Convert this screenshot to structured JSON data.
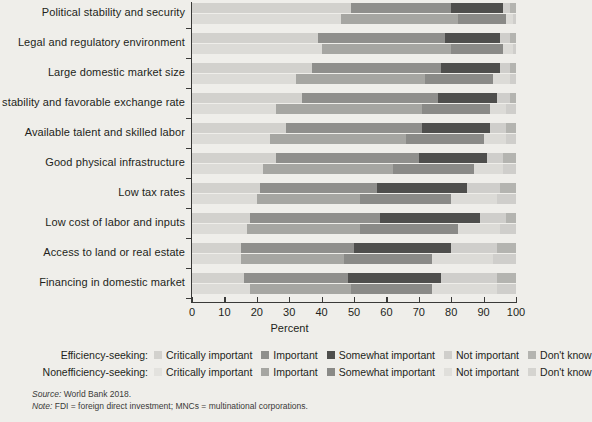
{
  "chart_data": {
    "type": "bar",
    "orientation": "horizontal",
    "stacked": true,
    "grouped_pairs": true,
    "title": "",
    "xlabel": "Percent",
    "ylabel": "",
    "xlim": [
      0,
      100
    ],
    "xticks": [
      0,
      10,
      20,
      30,
      40,
      50,
      60,
      70,
      80,
      90,
      100
    ],
    "grid": false,
    "legend_position": "bottom",
    "categories": [
      "Political stability and security",
      "Legal and regulatory environment",
      "Large domestic market size",
      "Macro stability and favorable exchange rate",
      "Available talent and skilled labor",
      "Good physical infrastructure",
      "Low tax rates",
      "Low cost of labor and inputs",
      "Access to land or real estate",
      "Financing in domestic market"
    ],
    "response_levels": [
      "Critically important",
      "Important",
      "Somewhat important",
      "Not important",
      "Don't know"
    ],
    "groups": [
      "Efficiency-seeking",
      "Nonefficiency-seeking"
    ],
    "series": [
      {
        "name": "Efficiency-seeking",
        "stacks": [
          {
            "category": "Political stability and security",
            "values": [
              49,
              31,
              16,
              2,
              2
            ]
          },
          {
            "category": "Legal and regulatory environment",
            "values": [
              39,
              39,
              17,
              3,
              2
            ]
          },
          {
            "category": "Large domestic market size",
            "values": [
              37,
              40,
              18,
              3,
              2
            ]
          },
          {
            "category": "Macro stability and favorable exchange rate",
            "values": [
              34,
              42,
              18,
              4,
              2
            ]
          },
          {
            "category": "Available talent and skilled labor",
            "values": [
              29,
              42,
              21,
              5,
              3
            ]
          },
          {
            "category": "Good physical infrastructure",
            "values": [
              26,
              44,
              21,
              5,
              4
            ]
          },
          {
            "category": "Low tax rates",
            "values": [
              21,
              36,
              28,
              10,
              5
            ]
          },
          {
            "category": "Low cost of labor and inputs",
            "values": [
              18,
              40,
              31,
              8,
              3
            ]
          },
          {
            "category": "Access to land or real estate",
            "values": [
              15,
              35,
              30,
              14,
              6
            ]
          },
          {
            "category": "Financing in domestic market",
            "values": [
              16,
              32,
              29,
              17,
              6
            ]
          }
        ]
      },
      {
        "name": "Nonefficiency-seeking",
        "stacks": [
          {
            "category": "Political stability and security",
            "values": [
              46,
              36,
              15,
              2,
              1
            ]
          },
          {
            "category": "Legal and regulatory environment",
            "values": [
              40,
              40,
              16,
              3,
              1
            ]
          },
          {
            "category": "Large domestic market size",
            "values": [
              32,
              40,
              21,
              5,
              2
            ]
          },
          {
            "category": "Macro stability and favorable exchange rate",
            "values": [
              26,
              45,
              21,
              5,
              3
            ]
          },
          {
            "category": "Available talent and skilled labor",
            "values": [
              24,
              42,
              24,
              7,
              3
            ]
          },
          {
            "category": "Good physical infrastructure",
            "values": [
              22,
              40,
              25,
              9,
              4
            ]
          },
          {
            "category": "Low tax rates",
            "values": [
              20,
              32,
              28,
              14,
              6
            ]
          },
          {
            "category": "Low cost of labor and inputs",
            "values": [
              17,
              35,
              30,
              13,
              5
            ]
          },
          {
            "category": "Access to land or real estate",
            "values": [
              15,
              32,
              27,
              19,
              7
            ]
          },
          {
            "category": "Financing in domestic market",
            "values": [
              18,
              31,
              25,
              20,
              6
            ]
          }
        ]
      }
    ],
    "colors": {
      "efficiency": [
        "#d4d3cf",
        "#aaaaa6",
        "#7f7f7c",
        "#5c5c59",
        "#bfbfbb",
        "#d9d8d4"
      ],
      "critically_important_eff": "#d2d1cd",
      "important_eff": "#8f8f8c",
      "somewhat_important_eff": "#4f4f4d",
      "not_important_eff": "#cfcecb",
      "dont_know_eff": "#b4b4b0",
      "critically_important_non": "#dcdbd7",
      "important_non": "#a6a6a2",
      "somewhat_important_non": "#8a8a87",
      "not_important_non": "#dcdbd7",
      "dont_know_non": "#cfcecb"
    }
  },
  "axis": {
    "xlabel": "Percent",
    "ticklabels": [
      "0",
      "10",
      "20",
      "30",
      "40",
      "50",
      "60",
      "70",
      "80",
      "90",
      "100"
    ]
  },
  "legend": {
    "rows": [
      {
        "title": "Efficiency-seeking:",
        "items": [
          {
            "label": "Critically important",
            "color": "#d2d1cd"
          },
          {
            "label": "Important",
            "color": "#8f8f8c"
          },
          {
            "label": "Somewhat important",
            "color": "#4f4f4d"
          },
          {
            "label": "Not important",
            "color": "#cfcecb"
          },
          {
            "label": "Don't know",
            "color": "#b4b4b0"
          }
        ]
      },
      {
        "title": "Nonefficiency-seeking:",
        "items": [
          {
            "label": "Critically important",
            "color": "#e3e2de"
          },
          {
            "label": "Important",
            "color": "#a6a6a2"
          },
          {
            "label": "Somewhat important",
            "color": "#8a8a87"
          },
          {
            "label": "Not important",
            "color": "#e0dfdb"
          },
          {
            "label": "Don't know",
            "color": "#d5d4d0"
          }
        ]
      }
    ]
  },
  "notes": {
    "source_label": "Source:",
    "source_text": " World Bank 2018.",
    "note_label": "Note:",
    "note_text": " FDI = foreign direct investment; MNCs = multinational corporations."
  }
}
